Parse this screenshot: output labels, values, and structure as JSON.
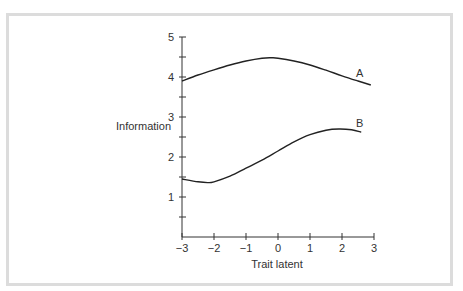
{
  "chart_data": {
    "type": "line",
    "title": "",
    "xlabel": "Trait latent",
    "ylabel": "Information",
    "xlim": [
      -3,
      3
    ],
    "ylim": [
      0,
      5
    ],
    "grid": false,
    "legend": "inline labels at curve ends",
    "x_ticks": [
      -3,
      -2,
      -1,
      0,
      1,
      2,
      3
    ],
    "x_tick_labels": [
      "−3",
      "−2",
      "−1",
      "0",
      "1",
      "2",
      "3"
    ],
    "y_ticks": [
      1,
      2,
      3,
      4,
      5
    ],
    "y_tick_labels": [
      "1",
      "2",
      "3",
      "4",
      "5"
    ],
    "y_minor_ticks": [
      0.5,
      1.5,
      2.5,
      3.5,
      4.5
    ],
    "series": [
      {
        "name": "A",
        "x": [
          -3,
          -2.5,
          -2,
          -1.5,
          -1,
          -0.5,
          -0.2,
          0,
          0.5,
          1,
          1.5,
          2,
          2.5,
          2.9
        ],
        "values": [
          3.9,
          4.05,
          4.18,
          4.3,
          4.4,
          4.47,
          4.48,
          4.47,
          4.4,
          4.3,
          4.17,
          4.03,
          3.9,
          3.8
        ]
      },
      {
        "name": "B",
        "x": [
          -3,
          -2.5,
          -2.2,
          -2,
          -1.5,
          -1,
          -0.5,
          0,
          0.5,
          1,
          1.5,
          1.9,
          2.3,
          2.6
        ],
        "values": [
          1.45,
          1.38,
          1.36,
          1.38,
          1.52,
          1.72,
          1.92,
          2.15,
          2.38,
          2.56,
          2.67,
          2.7,
          2.68,
          2.62
        ]
      }
    ]
  },
  "axes": {
    "xlabel": "Trait latent",
    "ylabel": "Information"
  },
  "labels": {
    "series_a": "A",
    "series_b": "B"
  }
}
